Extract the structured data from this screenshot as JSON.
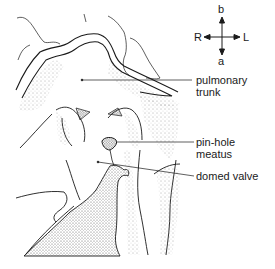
{
  "figure": {
    "type": "anatomical-line-drawing",
    "compass": {
      "top": "b",
      "bottom": "a",
      "left": "R",
      "right": "L"
    },
    "labels": [
      {
        "id": "pulmonary-trunk",
        "line1": "pulmonary",
        "line2": "trunk"
      },
      {
        "id": "pin-hole-meatus",
        "line1": "pin-hole",
        "line2": "meatus"
      },
      {
        "id": "domed-valve",
        "line1": "domed valve",
        "line2": ""
      }
    ],
    "colors": {
      "ink": "#1a1a1a",
      "stipple": "#555555",
      "background": "#ffffff"
    }
  }
}
